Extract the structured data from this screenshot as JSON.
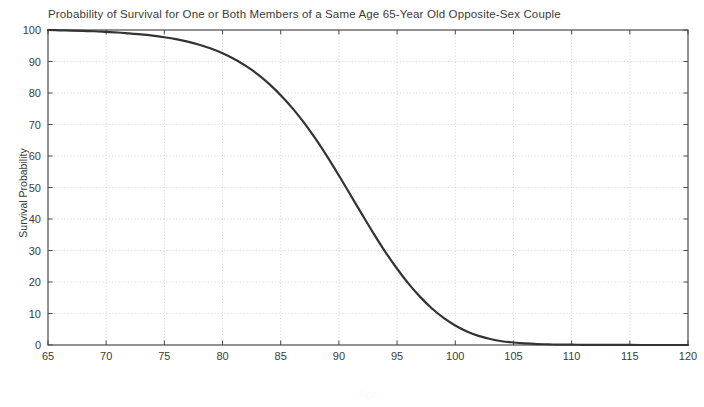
{
  "chart_data": {
    "type": "line",
    "title": "Probability of Survival for One or Both Members of a Same Age 65-Year Old Opposite-Sex Couple",
    "xlabel": "Age",
    "ylabel": "Survival Probability",
    "xlim": [
      65,
      120
    ],
    "ylim": [
      0,
      100
    ],
    "xticks": [
      65,
      70,
      75,
      80,
      85,
      90,
      95,
      100,
      105,
      110,
      115,
      120
    ],
    "yticks": [
      0,
      10,
      20,
      30,
      40,
      50,
      60,
      70,
      80,
      90,
      100
    ],
    "grid": true,
    "legend_position": "none",
    "series": [
      {
        "name": "Probability of Survival",
        "color": "#333333",
        "x": [
          65,
          66,
          67,
          68,
          69,
          70,
          71,
          72,
          73,
          74,
          75,
          76,
          77,
          78,
          79,
          80,
          81,
          82,
          83,
          84,
          85,
          86,
          87,
          88,
          89,
          90,
          91,
          92,
          93,
          94,
          95,
          96,
          97,
          98,
          99,
          100,
          101,
          102,
          103,
          104,
          105,
          106,
          107,
          108,
          109,
          110,
          111,
          112,
          113,
          114,
          115,
          116,
          117,
          118,
          119,
          120
        ],
        "values": [
          100,
          99.9,
          99.8,
          99.7,
          99.6,
          99.4,
          99.2,
          98.9,
          98.6,
          98.2,
          97.7,
          97.1,
          96.3,
          95.3,
          94.1,
          92.6,
          90.8,
          88.6,
          86.0,
          82.9,
          79.3,
          75.2,
          70.6,
          65.4,
          59.8,
          53.8,
          47.6,
          41.4,
          35.3,
          29.5,
          24.2,
          19.4,
          15.2,
          11.6,
          8.6,
          6.2,
          4.3,
          2.9,
          1.9,
          1.2,
          0.8,
          0.5,
          0.3,
          0.2,
          0.1,
          0.1,
          0.05,
          0.03,
          0.02,
          0.01,
          0.01,
          0.0,
          0.0,
          0.0,
          0.0,
          0.0
        ]
      }
    ]
  },
  "axes": {
    "x_tick_labels": [
      "65",
      "70",
      "75",
      "80",
      "85",
      "90",
      "95",
      "100",
      "105",
      "110",
      "115",
      "120"
    ],
    "y_tick_labels": [
      "0",
      "10",
      "20",
      "30",
      "40",
      "50",
      "60",
      "70",
      "80",
      "90",
      "100"
    ]
  }
}
